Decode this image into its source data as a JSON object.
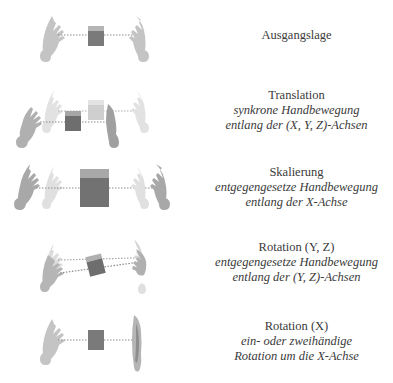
{
  "rows": [
    {
      "id": "ausgangslage",
      "title": "Ausgangslage",
      "lines": []
    },
    {
      "id": "translation",
      "title": "Translation",
      "lines": [
        "synkrone Handbewegung",
        "entlang der (X, Y, Z)-Achsen"
      ]
    },
    {
      "id": "skalierung",
      "title": "Skalierung",
      "lines": [
        "entgegengesetze Handbewegung",
        "entlang der X-Achse"
      ]
    },
    {
      "id": "rotation-yz",
      "title": "Rotation (Y, Z)",
      "lines": [
        "entgegengesetze Handbewegung",
        "entlang der (Y, Z)-Achsen"
      ]
    },
    {
      "id": "rotation-x",
      "title": "Rotation (X)",
      "lines": [
        "ein- oder zweihändige",
        "Rotation um die X-Achse"
      ]
    }
  ],
  "colors": {
    "cube_face": "#7a7a7a",
    "cube_top": "#b5b5b5",
    "cube_ghost_face": "#cfcfcf",
    "cube_ghost_top": "#e3e3e3",
    "hand": "#c4c4c4",
    "hand_dark": "#9a9a9a",
    "hand_ghost": "#e2e2e2",
    "dotted_line": "#8a8a8a",
    "text": "#3a3a3a"
  }
}
